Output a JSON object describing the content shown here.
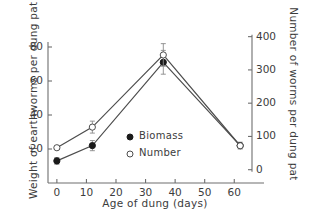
{
  "chart_data": {
    "type": "line",
    "title": "",
    "xlabel": "Age of dung (days)",
    "ylabel": "Weight of earthworms per dung pat (g)",
    "y2label": "Number of worms per dung pat",
    "x": [
      0,
      12,
      36,
      62
    ],
    "xlim": [
      -3,
      66
    ],
    "ylim": [
      0,
      90
    ],
    "y2lim": [
      -40,
      420
    ],
    "grid": false,
    "legend_position": "center",
    "xticks": [
      0,
      10,
      20,
      30,
      40,
      50,
      60
    ],
    "xticklabels": [
      "0",
      "10",
      "20",
      "30",
      "40",
      "50",
      "60"
    ],
    "yticks": [
      20,
      40,
      60,
      80
    ],
    "yticklabels": [
      "20",
      "40",
      "60",
      "80"
    ],
    "y2ticks": [
      0,
      100,
      200,
      300,
      400
    ],
    "y2ticklabels": [
      "0",
      "100",
      "200",
      "300",
      "400"
    ],
    "series": [
      {
        "name": "Biomass",
        "marker": "filled-circle",
        "axis": "left",
        "values": [
          13,
          22,
          71,
          22
        ],
        "errors": [
          2.0,
          3.0,
          7.0,
          2.0
        ]
      },
      {
        "name": "Number",
        "marker": "open-circle",
        "axis": "right",
        "values": [
          66,
          128,
          345,
          72
        ],
        "errors": [
          4,
          18,
          34,
          5
        ]
      }
    ]
  },
  "legend": {
    "entries": [
      {
        "label": "Biomass",
        "marker": "filled-circle"
      },
      {
        "label": "Number",
        "marker": "open-circle"
      }
    ]
  },
  "colors": {
    "line": "#4d4d4d",
    "marker_fill": "#1a1a1a",
    "marker_open": "#ffffff",
    "axis": "#6e6e6e",
    "text": "#3c3c3c",
    "background": "#ffffff"
  }
}
